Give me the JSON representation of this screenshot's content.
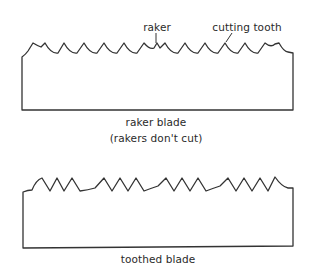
{
  "diagram": {
    "top_figure": {
      "name": "raker blade",
      "labels": {
        "raker": "raker",
        "cutting_tooth": "cutting tooth"
      },
      "caption_line1": "raker blade",
      "caption_line2": "(rakers don't cut)"
    },
    "bottom_figure": {
      "name": "toothed blade",
      "caption": "toothed blade"
    },
    "colors": {
      "stroke": "#333333",
      "background": "#ffffff",
      "text": "#2a2a2a"
    }
  }
}
